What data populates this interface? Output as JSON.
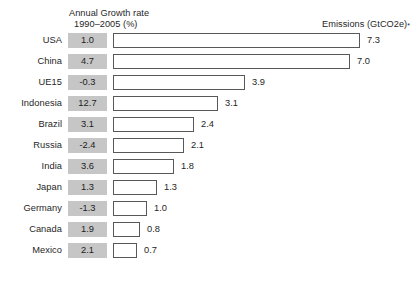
{
  "header": {
    "left_line1": "Annual Growth rate",
    "left_line2": "1990–2005 (%)",
    "right_label": "Emissions (GtCO2e)",
    "right_footnote_marker": "*"
  },
  "colors": {
    "growth_cell_background": "#c6c6c6",
    "bar_border": "#58585a",
    "bar_fill": "#ffffff",
    "text": "#1f1f1f",
    "page_background": "#ffffff"
  },
  "chart_data": {
    "type": "bar",
    "title": "",
    "subtitle": "",
    "orientation": "horizontal",
    "xlabel": "Emissions (GtCO2e)*",
    "ylabel": "",
    "categories": [
      "USA",
      "China",
      "UE15",
      "Indonesia",
      "Brazil",
      "Russia",
      "India",
      "Japan",
      "Germany",
      "Canada",
      "Mexico"
    ],
    "values": [
      7.3,
      7.0,
      3.9,
      3.1,
      2.4,
      2.1,
      1.8,
      1.3,
      1.0,
      0.8,
      0.7
    ],
    "value_labels": [
      "7.3",
      "7.0",
      "3.9",
      "3.1",
      "2.4",
      "2.1",
      "1.8",
      "1.3",
      "1.0",
      "0.8",
      "0.7"
    ],
    "xlim": [
      0,
      7.3
    ],
    "grid": false,
    "legend": "none",
    "series": [
      {
        "name": "Emissions (GtCO2e)",
        "values": [
          7.3,
          7.0,
          3.9,
          3.1,
          2.4,
          2.1,
          1.8,
          1.3,
          1.0,
          0.8,
          0.7
        ]
      },
      {
        "name": "Annual Growth rate 1990-2005 (%)",
        "values": [
          1.0,
          4.7,
          -0.3,
          12.7,
          3.1,
          -2.4,
          3.6,
          1.3,
          -1.3,
          1.9,
          2.1
        ]
      }
    ],
    "annotations": [
      "* footnote marker on Emissions (GtCO2e) header"
    ]
  },
  "rows": [
    {
      "country": "USA",
      "growth": "1.0",
      "emissions": "7.3",
      "emissions_value": 7.3
    },
    {
      "country": "China",
      "growth": "4.7",
      "emissions": "7.0",
      "emissions_value": 7.0
    },
    {
      "country": "UE15",
      "growth": "-0.3",
      "emissions": "3.9",
      "emissions_value": 3.9
    },
    {
      "country": "Indonesia",
      "growth": "12.7",
      "emissions": "3.1",
      "emissions_value": 3.1
    },
    {
      "country": "Brazil",
      "growth": "3.1",
      "emissions": "2.4",
      "emissions_value": 2.4
    },
    {
      "country": "Russia",
      "growth": "-2.4",
      "emissions": "2.1",
      "emissions_value": 2.1
    },
    {
      "country": "India",
      "growth": "3.6",
      "emissions": "1.8",
      "emissions_value": 1.8
    },
    {
      "country": "Japan",
      "growth": "1.3",
      "emissions": "1.3",
      "emissions_value": 1.3
    },
    {
      "country": "Germany",
      "growth": "-1.3",
      "emissions": "1.0",
      "emissions_value": 1.0
    },
    {
      "country": "Canada",
      "growth": "1.9",
      "emissions": "0.8",
      "emissions_value": 0.8
    },
    {
      "country": "Mexico",
      "growth": "2.1",
      "emissions": "0.7",
      "emissions_value": 0.7
    }
  ],
  "scale": {
    "pixels_per_unit": 33.8,
    "bar_origin_x": 113
  }
}
